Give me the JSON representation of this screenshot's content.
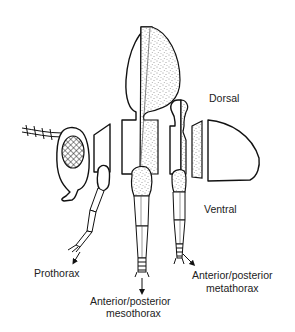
{
  "diagram": {
    "type": "insect-thorax-exploded-segments",
    "orientation_labels": {
      "dorsal": "Dorsal",
      "ventral": "Ventral"
    },
    "segment_labels": {
      "prothorax": "Prothorax",
      "mesothorax_line1": "Anterior/posterior",
      "mesothorax_line2": "mesothorax",
      "metathorax_line1": "Anterior/posterior",
      "metathorax_line2": "metathorax"
    },
    "parts": [
      {
        "id": "head",
        "name": "Head with antenna and compound eye"
      },
      {
        "id": "prothorax",
        "name": "Prothorax segment with leg"
      },
      {
        "id": "mesothorax",
        "name": "Mesothorax segment with wing and leg (anterior/posterior halves)"
      },
      {
        "id": "metathorax",
        "name": "Metathorax segment with haltere and leg (anterior/posterior halves)"
      },
      {
        "id": "abdomen",
        "name": "Abdomen segments"
      }
    ],
    "colors": {
      "line": "#111111",
      "background": "#ffffff",
      "stipple": "#333333"
    }
  }
}
